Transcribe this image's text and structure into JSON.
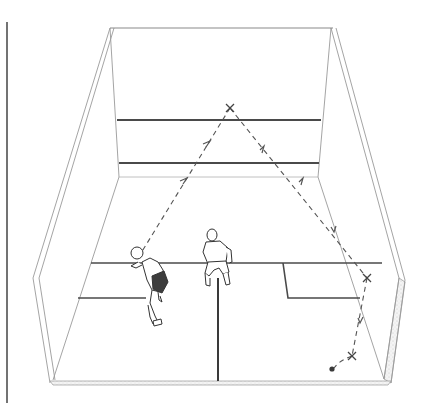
{
  "diagram": {
    "colors": {
      "background": "#ffffff",
      "line": "#4a4a4a",
      "thin_line": "#9a9a9a",
      "path": "#555555",
      "ball": "#3a3a3a"
    },
    "elements": {
      "margin_rule": "page-margin-rule",
      "court": {
        "front_wall_lines": [
          "out-line",
          "service-line",
          "tin-line"
        ],
        "floor_lines": [
          "short-line",
          "half-court-line",
          "left-service-box",
          "right-service-box"
        ]
      },
      "players": [
        {
          "id": "player-left",
          "pose": "bent forward, striking"
        },
        {
          "id": "player-center",
          "pose": "standing on T, back view"
        }
      ],
      "ball_path": {
        "points": [
          {
            "label": "start",
            "x": 138,
            "y": 258
          },
          {
            "label": "front-wall-contact",
            "marker": "x",
            "x": 230,
            "y": 108
          },
          {
            "label": "side-wall-contact",
            "marker": "x",
            "x": 367,
            "y": 278
          },
          {
            "label": "floor-bounce",
            "marker": "x",
            "x": 352,
            "y": 356
          },
          {
            "label": "ball",
            "marker": "dot",
            "x": 332,
            "y": 369
          }
        ]
      }
    }
  }
}
